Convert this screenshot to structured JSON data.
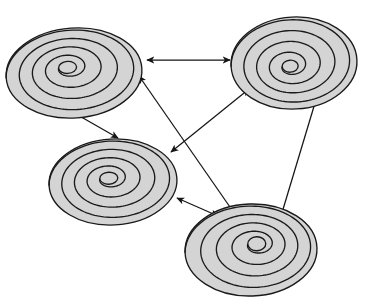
{
  "figure": {
    "background_color": "#ffffff",
    "width": 372,
    "height": 302,
    "node_fill_color": "#d4d4d4",
    "node_stroke_color": "#1a1a1a",
    "edge_color": "#151515"
  },
  "nodes": [
    {
      "id": "node-top-left",
      "label": "",
      "cx": 74,
      "cy": 73,
      "rx": 68,
      "ry": 45,
      "turns": 4,
      "core_rx": 9,
      "core_ry": 6,
      "core_dx": -6,
      "core_dy": -6,
      "rotation": -4
    },
    {
      "id": "node-top-right",
      "label": "",
      "cx": 294,
      "cy": 63,
      "rx": 63,
      "ry": 46,
      "turns": 4,
      "core_rx": 8,
      "core_ry": 6,
      "core_dx": -4,
      "core_dy": 3,
      "rotation": -3
    },
    {
      "id": "node-middle-left",
      "label": "",
      "cx": 113,
      "cy": 182,
      "rx": 64,
      "ry": 43,
      "turns": 4,
      "core_rx": 9,
      "core_ry": 6,
      "core_dx": -4,
      "core_dy": -4,
      "rotation": -3
    },
    {
      "id": "node-bottom-right",
      "label": "",
      "cx": 251,
      "cy": 250,
      "rx": 66,
      "ry": 46,
      "turns": 4,
      "core_rx": 9,
      "core_ry": 7,
      "core_dx": 6,
      "core_dy": -6,
      "rotation": -2
    }
  ],
  "edges": [
    {
      "id": "edge-top-left--top-right",
      "from": "node-top-left",
      "to": "node-top-right",
      "x1": 147,
      "y1": 60,
      "x2": 230,
      "y2": 60,
      "arrowheads": "both",
      "label": ""
    },
    {
      "id": "edge-top-left--middle-left",
      "from": "node-top-left",
      "to": "node-middle-left",
      "x1": 69,
      "y1": 110,
      "x2": 118,
      "y2": 138,
      "arrowheads": "both",
      "label": ""
    },
    {
      "id": "edge-top-left--bottom-right",
      "from": "node-top-left",
      "to": "node-bottom-right",
      "x1": 139,
      "y1": 76,
      "x2": 248,
      "y2": 233,
      "arrowheads": "both",
      "label": ""
    },
    {
      "id": "edge-middle-left--top-right",
      "from": "node-middle-left",
      "to": "node-top-right",
      "x1": 171,
      "y1": 152,
      "x2": 249,
      "y2": 89,
      "arrowheads": "both",
      "label": ""
    },
    {
      "id": "edge-middle-left--bottom-right",
      "from": "node-middle-left",
      "to": "node-bottom-right",
      "x1": 177,
      "y1": 198,
      "x2": 218,
      "y2": 216,
      "arrowheads": "both",
      "label": ""
    },
    {
      "id": "edge-top-right--bottom-right",
      "from": "node-top-right",
      "to": "node-bottom-right",
      "x1": 318,
      "y1": 93,
      "x2": 281,
      "y2": 216,
      "arrowheads": "both",
      "label": ""
    }
  ]
}
